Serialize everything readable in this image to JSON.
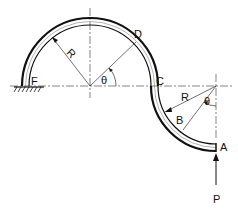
{
  "diagram": {
    "labels": {
      "F": "F",
      "D": "D",
      "C": "C",
      "B": "B",
      "A": "A",
      "P": "P",
      "R1": "R",
      "R2": "R",
      "theta1": "θ",
      "theta2": "θ"
    },
    "colors": {
      "line": "#111111",
      "background": "#ffffff"
    }
  }
}
